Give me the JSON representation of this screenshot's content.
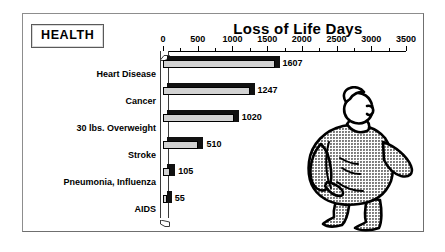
{
  "badge": {
    "label": "HEALTH"
  },
  "chart_data": {
    "type": "bar",
    "orientation": "horizontal",
    "title": "Loss of Life Days",
    "xlabel": "",
    "ylabel": "",
    "xlim": [
      0,
      3500
    ],
    "xticks": [
      0,
      500,
      1000,
      1500,
      2000,
      2500,
      3000,
      3500
    ],
    "xtick_labels": [
      "0",
      "500",
      "1000",
      "1500",
      "2000",
      "2500",
      "3000",
      "3500"
    ],
    "minor_ticks": true,
    "grid": false,
    "legend": null,
    "categories": [
      "Heart Disease",
      "Cancer",
      "30 lbs. Overweight",
      "Stroke",
      "Pneumonia, Influenza",
      "AIDS"
    ],
    "values": [
      1607,
      1247,
      1020,
      510,
      105,
      55
    ],
    "value_labels": [
      "1607",
      "1247",
      "1020",
      "510",
      "105",
      "55"
    ],
    "bar_face_color": "#d2d2d2",
    "bar_shade_color": "#111111",
    "style": "3d-block"
  },
  "illustration": {
    "name": "overweight-person-cartoon",
    "fill_color": "#9b9b9b"
  },
  "frame": {
    "border_color": "#8d8d8d"
  }
}
